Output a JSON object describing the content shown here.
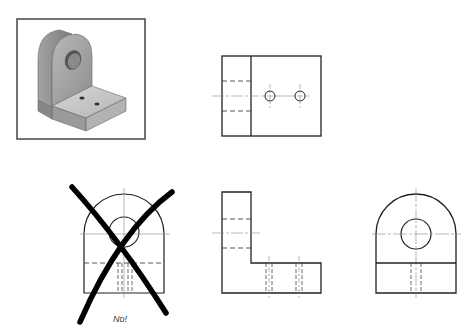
{
  "figure": {
    "type": "orthographic-projection-exercise",
    "colors": {
      "line": "#222222",
      "center_line": "#888888",
      "cross": "#000000",
      "shade_light": "#c9c9c9",
      "shade_mid": "#a9a9a9",
      "shade_dark": "#7d7d7d",
      "frame": "#444444"
    },
    "views": [
      {
        "name": "isometric-pictorial",
        "framed": true
      },
      {
        "name": "top-view"
      },
      {
        "name": "incorrect-front-view",
        "crossed_out": true,
        "label": "No!"
      },
      {
        "name": "front-view"
      },
      {
        "name": "right-side-view"
      }
    ],
    "incorrect_label": "No!"
  }
}
